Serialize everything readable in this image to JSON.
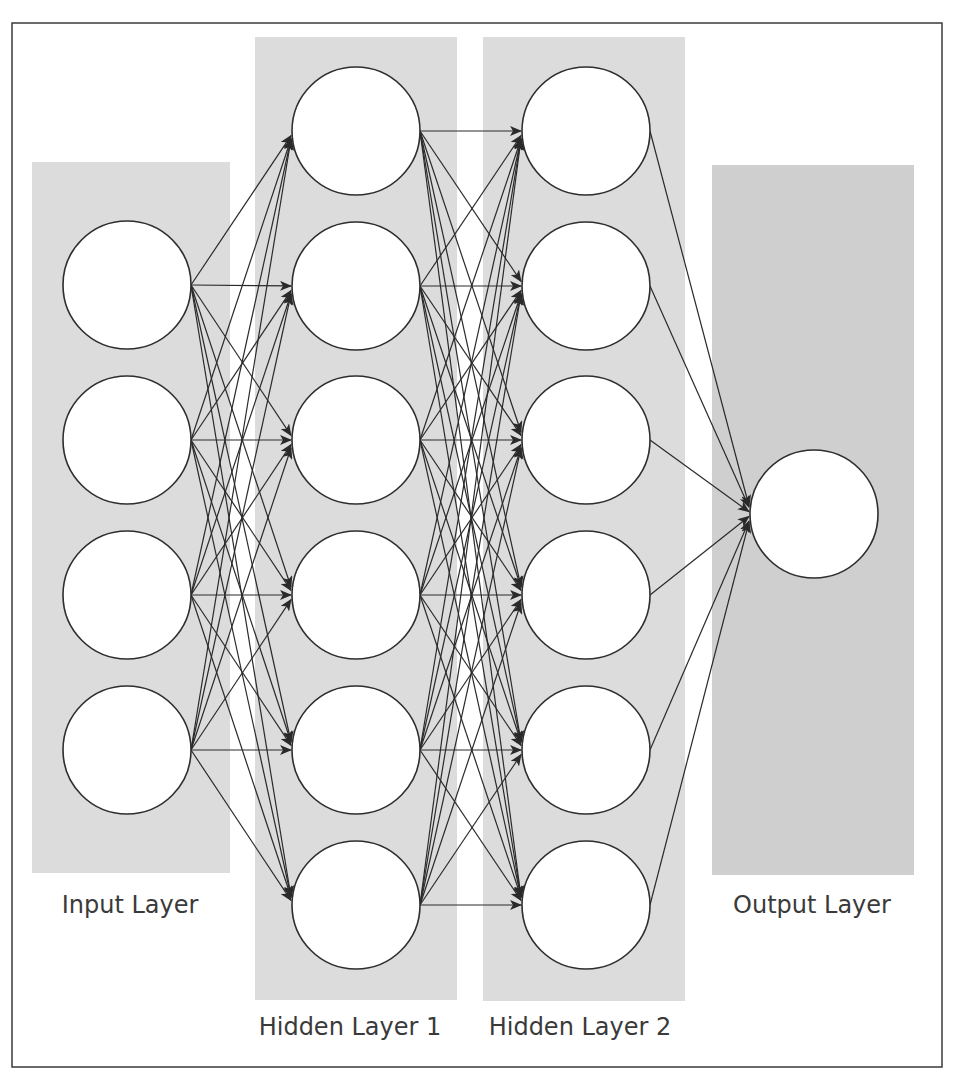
{
  "diagram": {
    "colors": {
      "frame": "#3a3a3a",
      "layer_background": "#dcdcdc",
      "output_background": "#cfcfcf",
      "node_fill": "#ffffff",
      "node_stroke": "#2e2e2e",
      "edge": "#2a2a2a",
      "label": "#3a3a3a"
    },
    "frame": {
      "x": 12,
      "y": 23,
      "width": 930,
      "height": 1044
    },
    "node_radius": 64,
    "layers": [
      {
        "id": "input",
        "label": "Input Layer",
        "label_pos": {
          "x": 130,
          "y": 913
        },
        "background": {
          "x": 32,
          "y": 162,
          "width": 198,
          "height": 711
        },
        "node_x": 127,
        "node_y": [
          285,
          440,
          595,
          750
        ]
      },
      {
        "id": "hidden1",
        "label": "Hidden Layer 1",
        "label_pos": {
          "x": 350,
          "y": 1035
        },
        "background": {
          "x": 255,
          "y": 37,
          "width": 202,
          "height": 963
        },
        "node_x": 356,
        "node_y": [
          131,
          286,
          440,
          595,
          750,
          905
        ]
      },
      {
        "id": "hidden2",
        "label": "Hidden Layer 2",
        "label_pos": {
          "x": 580,
          "y": 1035
        },
        "background": {
          "x": 483,
          "y": 37,
          "width": 202,
          "height": 964
        },
        "node_x": 586,
        "node_y": [
          131,
          286,
          440,
          595,
          750,
          905
        ]
      },
      {
        "id": "output",
        "label": "Output Layer",
        "label_pos": {
          "x": 812,
          "y": 913
        },
        "background": {
          "x": 712,
          "y": 165,
          "width": 202,
          "height": 710
        },
        "node_x": 814,
        "node_y": [
          514
        ]
      }
    ],
    "connections": "fully-connected"
  }
}
